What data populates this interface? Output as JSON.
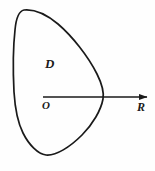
{
  "figure": {
    "kind": "geometry-diagram",
    "background_color": "#fefefe",
    "stroke_color": "#1a1a1a",
    "labels": {
      "region": "D",
      "origin": "O",
      "radius": "R"
    },
    "geometry": {
      "region_boundary_path": "M 24 10 C 34 9 46 14 58 24 C 72 36 88 56 97 74 C 103 86 104 93 103 99 C 101 110 93 124 82 135 C 70 147 56 156 46 155 C 38 154 29 145 23 133 C 17 121 15 108 14 92 C 13 72 13 48 15 30 C 16 19 19 11 24 10 Z",
      "arrow_line": {
        "x1": 43,
        "y1": 97,
        "x2": 148,
        "y2": 97
      },
      "arrow_head": {
        "tip_x": 150,
        "tip_y": 97,
        "width": 10,
        "height": 6
      },
      "origin_point": {
        "x": 43,
        "y": 97
      },
      "boundary_crossing_point": {
        "x": 103,
        "y": 97
      }
    }
  }
}
